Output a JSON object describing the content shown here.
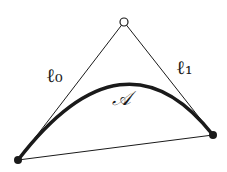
{
  "diagram": {
    "type": "quadratic-bezier-curve",
    "points": {
      "p0": {
        "x": 18,
        "y": 160,
        "style": "filled"
      },
      "p1": {
        "x": 124,
        "y": 22,
        "style": "hollow"
      },
      "p2": {
        "x": 213,
        "y": 135,
        "style": "filled"
      }
    },
    "labels": {
      "l0": "ℓ₀",
      "l1": "ℓ₁",
      "area": "𝒜"
    },
    "colors": {
      "stroke": "#1a1a1a",
      "background": "#ffffff"
    }
  }
}
